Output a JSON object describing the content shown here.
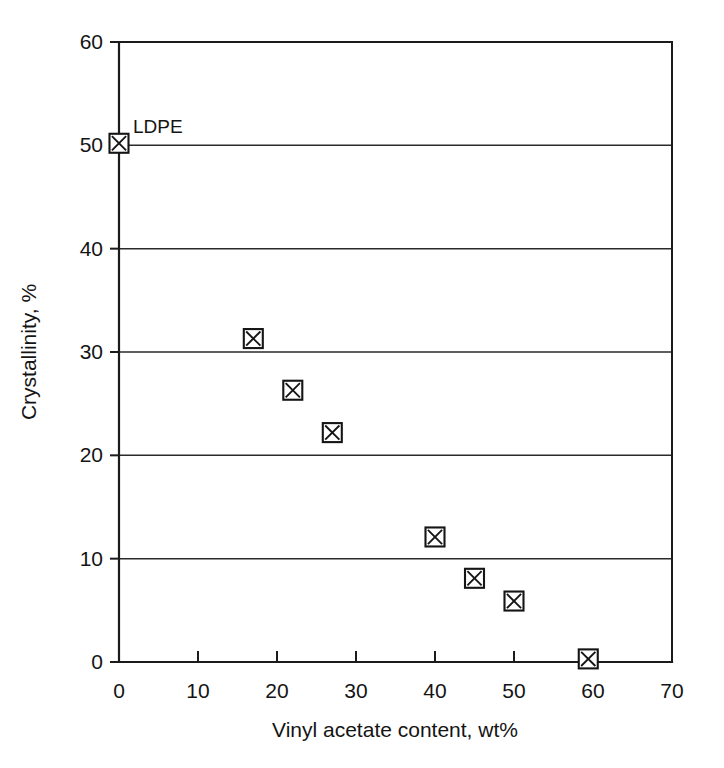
{
  "chart_data": {
    "type": "scatter",
    "title": "",
    "subtitle": "",
    "xlabel": "Vinyl acetate content, wt%",
    "ylabel": "Crystallinity, %",
    "xlim": [
      0,
      70
    ],
    "ylim": [
      0,
      60
    ],
    "xticks": [
      0,
      10,
      20,
      30,
      40,
      50,
      60,
      70
    ],
    "yticks": [
      0,
      10,
      20,
      30,
      40,
      50,
      60
    ],
    "xtick_labels": [
      "0",
      "10",
      "20",
      "30",
      "40",
      "50",
      "60",
      "70"
    ],
    "ytick_labels": [
      "0",
      "10",
      "20",
      "30",
      "40",
      "50",
      "60"
    ],
    "grid": {
      "horizontal": true,
      "vertical": false,
      "gridline_values": [
        10,
        20,
        30,
        40,
        50
      ]
    },
    "legend": {
      "present": false,
      "position": "none"
    },
    "marker_style": "square-with-x",
    "marker_color": "#151515",
    "marker_fill": "#ffffff",
    "series": [
      {
        "name": "EVA copolymers",
        "points": [
          {
            "x": 0,
            "y": 50.2,
            "label": "LDPE"
          },
          {
            "x": 17,
            "y": 31.3,
            "label": ""
          },
          {
            "x": 22,
            "y": 26.3,
            "label": ""
          },
          {
            "x": 27,
            "y": 22.2,
            "label": ""
          },
          {
            "x": 40,
            "y": 12.1,
            "label": ""
          },
          {
            "x": 45,
            "y": 8.1,
            "label": ""
          },
          {
            "x": 50,
            "y": 5.9,
            "label": ""
          },
          {
            "x": 59.4,
            "y": 0.3,
            "label": ""
          }
        ]
      }
    ],
    "annotations": [
      {
        "text": "LDPE",
        "x": 0,
        "y": 50.2,
        "dx": 14,
        "dy": -10
      }
    ]
  },
  "colors": {
    "axis": "#1b1b1b",
    "grid": "#2a2a2a",
    "text": "#141414",
    "background": "#ffffff"
  }
}
